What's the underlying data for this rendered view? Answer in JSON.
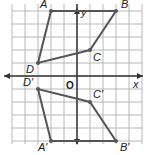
{
  "diagram": {
    "type": "coordinate-grid-reflection",
    "axes": {
      "x_label": "x",
      "y_label": "y",
      "origin_label": "O"
    },
    "grid": {
      "x_range": [
        -5,
        5
      ],
      "y_range": [
        -5,
        5
      ]
    },
    "colors": {
      "grid": "#b8b8b8",
      "axis": "#333333",
      "polygon": "#555555"
    },
    "original": {
      "vertices": [
        {
          "label": "A",
          "x": -2,
          "y": 5
        },
        {
          "label": "B",
          "x": 3,
          "y": 5
        },
        {
          "label": "C",
          "x": 1,
          "y": 2
        },
        {
          "label": "D",
          "x": -3,
          "y": 1
        }
      ]
    },
    "image": {
      "vertices": [
        {
          "label": "A′",
          "x": -2,
          "y": -5
        },
        {
          "label": "B′",
          "x": 3,
          "y": -5
        },
        {
          "label": "C′",
          "x": 1,
          "y": -2
        },
        {
          "label": "D′",
          "x": -3,
          "y": -1
        }
      ]
    }
  }
}
